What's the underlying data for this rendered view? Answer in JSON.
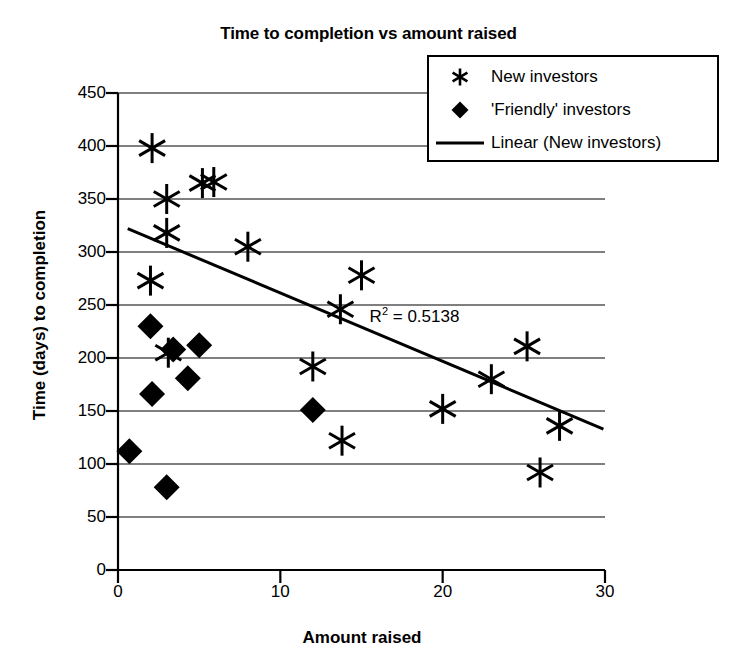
{
  "chart_data": {
    "type": "scatter",
    "title": "Time to completion vs amount raised",
    "xlabel": "Amount raised",
    "ylabel": "Time (days) to completion",
    "xlim": [
      0,
      30
    ],
    "ylim": [
      0,
      450
    ],
    "xticks": [
      0,
      10,
      20,
      30
    ],
    "yticks": [
      0,
      50,
      100,
      150,
      200,
      250,
      300,
      350,
      400,
      450
    ],
    "grid": true,
    "grid_axis": "y",
    "legend_position": "top-right",
    "annotations": [
      {
        "text": "R² = 0.5138",
        "x": 15.5,
        "y": 240
      }
    ],
    "series": [
      {
        "name": "New investors",
        "marker": "asterisk",
        "color": "#000000",
        "points": [
          {
            "x": 2.1,
            "y": 398
          },
          {
            "x": 3.0,
            "y": 350
          },
          {
            "x": 5.2,
            "y": 365
          },
          {
            "x": 5.9,
            "y": 366
          },
          {
            "x": 3.0,
            "y": 318
          },
          {
            "x": 8.0,
            "y": 305
          },
          {
            "x": 2.0,
            "y": 273
          },
          {
            "x": 15.0,
            "y": 278
          },
          {
            "x": 13.7,
            "y": 246
          },
          {
            "x": 3.1,
            "y": 205
          },
          {
            "x": 12.0,
            "y": 192
          },
          {
            "x": 25.2,
            "y": 211
          },
          {
            "x": 23.0,
            "y": 180
          },
          {
            "x": 20.0,
            "y": 152
          },
          {
            "x": 27.2,
            "y": 136
          },
          {
            "x": 13.8,
            "y": 122
          },
          {
            "x": 26.0,
            "y": 92
          }
        ]
      },
      {
        "name": "'Friendly' investors",
        "marker": "diamond",
        "color": "#000000",
        "points": [
          {
            "x": 2.0,
            "y": 230
          },
          {
            "x": 3.4,
            "y": 208
          },
          {
            "x": 5.0,
            "y": 212
          },
          {
            "x": 4.3,
            "y": 181
          },
          {
            "x": 2.1,
            "y": 166
          },
          {
            "x": 12.0,
            "y": 151
          },
          {
            "x": 0.7,
            "y": 112
          },
          {
            "x": 3.0,
            "y": 78
          }
        ]
      }
    ],
    "trendline": {
      "name": "Linear (New investors)",
      "color": "#000000",
      "x_start": 0.6,
      "y_start": 322,
      "x_end": 29.9,
      "y_end": 133
    }
  },
  "legend": {
    "items": [
      {
        "label": "New investors",
        "symbol": "asterisk-marker"
      },
      {
        "label": "'Friendly' investors",
        "symbol": "diamond-marker"
      },
      {
        "label": "Linear (New investors)",
        "symbol": "line-marker"
      }
    ]
  }
}
